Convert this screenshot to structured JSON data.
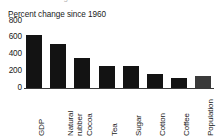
{
  "chart_data": {
    "type": "bar",
    "title": "",
    "subtitle": "Percent change since 1960",
    "xlabel": "",
    "ylabel": "",
    "ylim": [
      0,
      800
    ],
    "yticks": [
      "0",
      "200",
      "400",
      "600",
      "800"
    ],
    "grid": false,
    "legend": null,
    "categories": [
      "GDP",
      "Natural rubber",
      "Cocoa",
      "Tea",
      "Sugar",
      "Cotton",
      "Coffee",
      "Population"
    ],
    "values": [
      625,
      525,
      355,
      255,
      255,
      170,
      120,
      145
    ],
    "bar_color": "#131313",
    "axis_color": "#3a3a3a"
  },
  "axis": {
    "y_ticks": [
      {
        "label": "800",
        "value": 800
      },
      {
        "label": "600",
        "value": 600
      },
      {
        "label": "400",
        "value": 400
      },
      {
        "label": "200",
        "value": 200
      },
      {
        "label": "0",
        "value": 0
      }
    ],
    "x_categories": [
      {
        "label": "GDP",
        "value": 625,
        "multiline": false
      },
      {
        "label": "Natural rubber",
        "value": 525,
        "multiline": true
      },
      {
        "label": "Cocoa",
        "value": 355,
        "multiline": false
      },
      {
        "label": "Tea",
        "value": 255,
        "multiline": false
      },
      {
        "label": "Sugar",
        "value": 255,
        "multiline": false
      },
      {
        "label": "Cotton",
        "value": 170,
        "multiline": false
      },
      {
        "label": "Coffee",
        "value": 120,
        "multiline": false
      },
      {
        "label": "Population",
        "value": 145,
        "multiline": false
      }
    ]
  },
  "header": {
    "cropped_text": "Percent change since 1960"
  }
}
